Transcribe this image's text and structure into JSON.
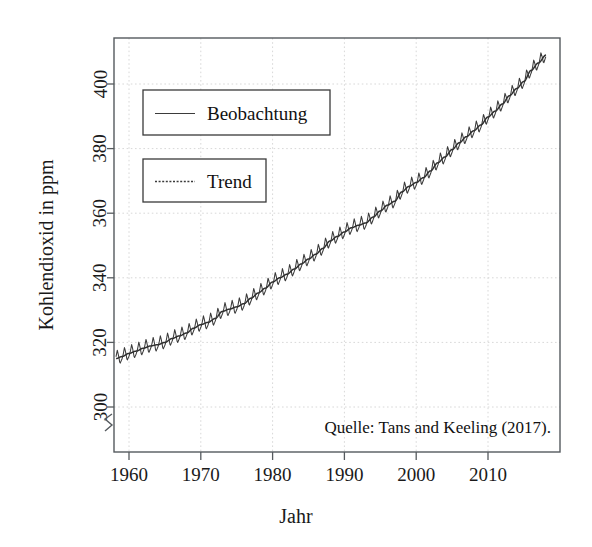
{
  "chart_data": {
    "type": "line",
    "title": "",
    "xlabel": "Jahr",
    "ylabel": "Kohlendioxid in ppm",
    "xlim": [
      1957.5,
      2018.5
    ],
    "ylim": [
      296,
      412
    ],
    "grid": true,
    "xticks": [
      1960,
      1970,
      1980,
      1990,
      2000,
      2010
    ],
    "xtick_labels": [
      "1960",
      "1970",
      "1980",
      "1990",
      "2000",
      "2010"
    ],
    "yticks": [
      300,
      320,
      340,
      360,
      380,
      400
    ],
    "ytick_labels": [
      "300",
      "320",
      "340",
      "360",
      "380",
      "400"
    ],
    "y_axis_break_below": 300,
    "legend_position": "upper-left",
    "legend_entries": [
      {
        "label": "Beobachtung",
        "style": "solid",
        "color": "#3b3b3b"
      },
      {
        "label": "Trend",
        "style": "dashed",
        "color": "#3b3b3b"
      }
    ],
    "annotations": [
      {
        "text": "Quelle: Tans and Keeling (2017).",
        "position": "bottom-right"
      }
    ],
    "seasonal_amplitude_ppm": 3.1,
    "series": [
      {
        "name": "Trend",
        "note": "annual-mean CO2 trend, Mauna Loa",
        "x": [
          1958.2,
          1959,
          1960,
          1961,
          1962,
          1963,
          1964,
          1965,
          1966,
          1967,
          1968,
          1969,
          1970,
          1971,
          1972,
          1973,
          1974,
          1975,
          1976,
          1977,
          1978,
          1979,
          1980,
          1981,
          1982,
          1983,
          1984,
          1985,
          1986,
          1987,
          1988,
          1989,
          1990,
          1991,
          1992,
          1993,
          1994,
          1995,
          1996,
          1997,
          1998,
          1999,
          2000,
          2001,
          2002,
          2003,
          2004,
          2005,
          2006,
          2007,
          2008,
          2009,
          2010,
          2011,
          2012,
          2013,
          2014,
          2015,
          2016,
          2017,
          2018.1
        ],
        "values": [
          315.0,
          315.6,
          316.6,
          317.3,
          318.2,
          318.9,
          319.3,
          320.0,
          321.2,
          322.0,
          322.9,
          324.4,
          325.5,
          326.2,
          327.4,
          329.6,
          330.3,
          331.0,
          332.0,
          333.7,
          335.3,
          336.8,
          338.7,
          340.0,
          341.1,
          342.7,
          344.3,
          345.8,
          347.3,
          349.1,
          351.4,
          352.8,
          354.2,
          355.5,
          356.3,
          357.0,
          358.8,
          360.7,
          362.5,
          363.7,
          366.6,
          368.3,
          369.5,
          371.0,
          373.1,
          375.6,
          377.4,
          379.7,
          381.8,
          383.7,
          385.5,
          387.3,
          389.8,
          391.6,
          393.8,
          396.4,
          398.6,
          400.8,
          404.2,
          406.5,
          409.0
        ]
      },
      {
        "name": "Beobachtung",
        "note": "monthly observed CO2 = trend + seasonal cycle (peak May, min Sept/Oct)",
        "derived_from": "Trend",
        "seasonal_model": "amplitude 3.1 ppm, sawtooth-like annual cycle"
      }
    ]
  },
  "layout": {
    "plot_left": 114,
    "plot_right": 560,
    "plot_top": 38,
    "plot_bottom": 452,
    "y_px_at_300": 407,
    "y_px_at_400": 84,
    "x_px_at_1960": 129,
    "x_px_at_2010": 488
  },
  "legend": {
    "box1": {
      "x": 143,
      "y": 90,
      "w": 187,
      "h": 45
    },
    "box2": {
      "x": 143,
      "y": 159,
      "w": 123,
      "h": 43
    }
  },
  "colors": {
    "line": "#3b3b3b",
    "axis": "#555a5e",
    "grid": "#d8d8d8",
    "text": "#1a1a1a",
    "background": "#ffffff"
  }
}
